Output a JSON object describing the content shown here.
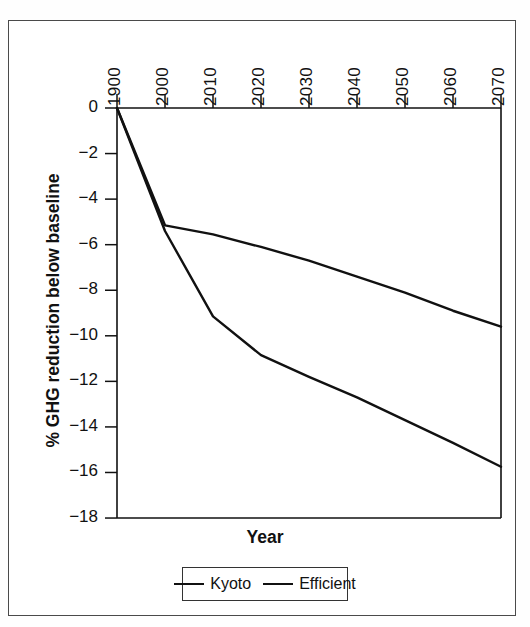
{
  "chart_data": {
    "type": "line",
    "title": "",
    "xlabel": "Year",
    "ylabel": "% GHG reduction below baseline",
    "xtick_labels": [
      "1900",
      "2000",
      "2010",
      "2020",
      "2030",
      "2040",
      "2050",
      "2060",
      "2070"
    ],
    "xtick_values": [
      1900,
      2000,
      2010,
      2020,
      2030,
      2040,
      2050,
      2060,
      2070
    ],
    "ytick_labels": [
      "0",
      "−2",
      "−4",
      "−6",
      "−8",
      "−10",
      "−12",
      "−14",
      "−16",
      "−18"
    ],
    "ytick_values": [
      0,
      -2,
      -4,
      -6,
      -8,
      -10,
      -12,
      -14,
      -16,
      -18
    ],
    "ylim": [
      -18,
      0
    ],
    "grid": false,
    "xaxis_position": "top",
    "legend_position": "bottom-center",
    "line_color": "#111111",
    "series": [
      {
        "name": "Kyoto",
        "x": [
          1900,
          2000,
          2010,
          2020,
          2030,
          2040,
          2050,
          2060,
          2070
        ],
        "values": [
          0,
          -5.15,
          -5.55,
          -6.1,
          -6.7,
          -7.4,
          -8.1,
          -8.9,
          -9.6
        ]
      },
      {
        "name": "Efficient",
        "x": [
          1900,
          2000,
          2010,
          2020,
          2030,
          2040,
          2050,
          2060,
          2070
        ],
        "values": [
          0,
          -5.4,
          -9.15,
          -10.85,
          -11.8,
          -12.7,
          -13.7,
          -14.7,
          -15.75
        ]
      }
    ]
  },
  "legend": {
    "entries": [
      {
        "label": "Kyoto"
      },
      {
        "label": "Efficient"
      }
    ]
  },
  "axis": {
    "x_title": "Year",
    "y_title": "% GHG reduction below baseline"
  }
}
